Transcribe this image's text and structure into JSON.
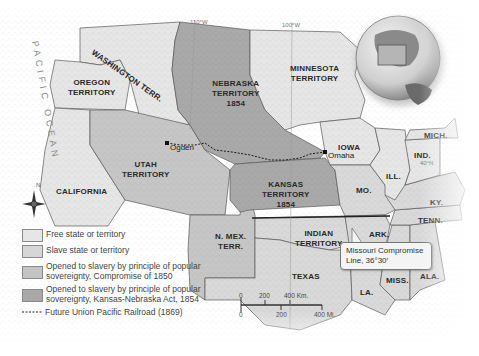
{
  "map": {
    "ocean_label": "PACIFIC OCEAN",
    "meridians": [
      "110°W",
      "100°W",
      "40°N"
    ],
    "regions": [
      {
        "id": "washington",
        "name": "WASHINGTON TERR.",
        "category": "free"
      },
      {
        "id": "oregon",
        "name": "OREGON TERRITORY",
        "category": "free"
      },
      {
        "id": "california",
        "name": "CALIFORNIA",
        "category": "free"
      },
      {
        "id": "utah",
        "name": "UTAH TERRITORY",
        "category": "compromise_1850"
      },
      {
        "id": "nmex",
        "name": "N. MEX. TERR.",
        "category": "compromise_1850"
      },
      {
        "id": "nebraska",
        "name": "NEBRASKA TERRITORY 1854",
        "category": "kansas_nebraska_1854"
      },
      {
        "id": "kansas",
        "name": "KANSAS TERRITORY 1854",
        "category": "kansas_nebraska_1854"
      },
      {
        "id": "minnesota",
        "name": "MINNESOTA TERRITORY",
        "category": "free"
      },
      {
        "id": "iowa",
        "name": "IOWA",
        "category": "free"
      },
      {
        "id": "indian",
        "name": "INDIAN TERRITORY",
        "category": "slave"
      },
      {
        "id": "texas",
        "name": "TEXAS",
        "category": "slave"
      },
      {
        "id": "mo",
        "name": "MO.",
        "category": "slave"
      },
      {
        "id": "ark",
        "name": "ARK.",
        "category": "slave"
      },
      {
        "id": "la",
        "name": "LA.",
        "category": "slave"
      },
      {
        "id": "miss",
        "name": "MISS.",
        "category": "slave"
      },
      {
        "id": "ala",
        "name": "ALA.",
        "category": "slave"
      },
      {
        "id": "tenn",
        "name": "TENN.",
        "category": "slave"
      },
      {
        "id": "ky",
        "name": "KY.",
        "category": "slave"
      },
      {
        "id": "ill",
        "name": "ILL.",
        "category": "free"
      },
      {
        "id": "ind",
        "name": "IND.",
        "category": "free"
      },
      {
        "id": "mich",
        "name": "MICH.",
        "category": "free"
      }
    ],
    "labels": {
      "washington": "WASHINGTON TERR.",
      "oregon": [
        "OREGON",
        "TERRITORY"
      ],
      "california": "CALIFORNIA",
      "utah": [
        "UTAH",
        "TERRITORY"
      ],
      "nmex": [
        "N. MEX.",
        "TERR."
      ],
      "nebraska": [
        "NEBRASKA",
        "TERRITORY",
        "1854"
      ],
      "kansas": [
        "KANSAS",
        "TERRITORY",
        "1854"
      ],
      "minnesota": [
        "MINNESOTA",
        "TERRITORY"
      ],
      "iowa": "IOWA",
      "indian": [
        "INDIAN",
        "TERRITORY"
      ],
      "texas": "TEXAS",
      "mo": "MO.",
      "ark": "ARK.",
      "la": "LA.",
      "miss": "MISS.",
      "ala": "ALA.",
      "tenn": "TENN.",
      "ky": "KY.",
      "ill": "ILL.",
      "ind": "IND.",
      "mich": "MICH."
    },
    "cities": [
      {
        "name": "Ogden"
      },
      {
        "name": "Omaha"
      }
    ],
    "callout": {
      "line1": "Missouri Compromise",
      "line2": "Line, 36°30′"
    },
    "scale": {
      "km_ticks": [
        "0",
        "200",
        "400 Km."
      ],
      "mi_ticks": [
        "0",
        "200",
        "400 Mi."
      ]
    },
    "colors": {
      "free": "#e6e6e6",
      "slave": "#d9d9d9",
      "compromise_1850": "#c6c6c6",
      "kansas_nebraska_1854": "#a9a9a9",
      "border": "#5a5a5a",
      "railroad": "#1a1a1a"
    }
  },
  "legend": {
    "items": [
      {
        "label": "Free state or territory",
        "color": "#e6e6e6"
      },
      {
        "label": "Slave state or territory",
        "color": "#d6d6d6"
      },
      {
        "label": "Opened to slavery by principle of popular sovereignty, Compromise of 1850",
        "color": "#c4c4c4"
      },
      {
        "label": "Opened to slavery by principle of popular sovereignty, Kansas-Nebraska Act, 1854",
        "color": "#a8a8a8"
      }
    ],
    "railroad_label": "Future Union Pacific Railroad (1869)"
  }
}
